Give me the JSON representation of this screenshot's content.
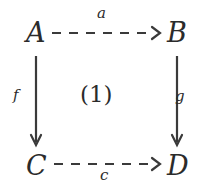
{
  "diagram": {
    "type": "commutative-square",
    "background_color": "#ffffff",
    "ink_color": "#2b2b2b",
    "nodes": [
      {
        "id": "A",
        "label": "A",
        "position": "top-left"
      },
      {
        "id": "B",
        "label": "B",
        "position": "top-right"
      },
      {
        "id": "C",
        "label": "C",
        "position": "bottom-left"
      },
      {
        "id": "D",
        "label": "D",
        "position": "bottom-right"
      }
    ],
    "edges": [
      {
        "id": "a",
        "label": "a",
        "from": "A",
        "to": "B",
        "style": "dashed",
        "orientation": "horizontal",
        "label_position": "above"
      },
      {
        "id": "c",
        "label": "c",
        "from": "C",
        "to": "D",
        "style": "dashed",
        "orientation": "horizontal",
        "label_position": "below"
      },
      {
        "id": "f",
        "label": "f",
        "from": "A",
        "to": "C",
        "style": "solid",
        "orientation": "vertical",
        "label_position": "left"
      },
      {
        "id": "g",
        "label": "g",
        "from": "B",
        "to": "D",
        "style": "solid",
        "orientation": "vertical",
        "label_position": "right"
      }
    ],
    "cell": {
      "label": "(1)",
      "position": "center"
    }
  }
}
